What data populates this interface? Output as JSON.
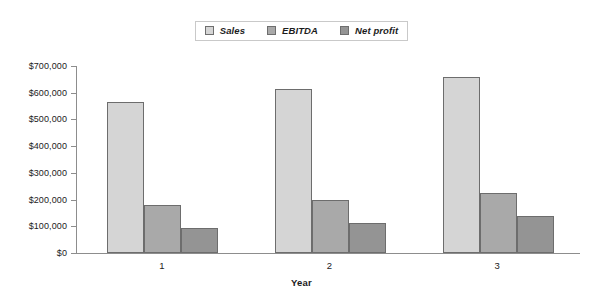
{
  "chart_data": {
    "type": "bar",
    "title": "",
    "xlabel": "Year",
    "ylabel": "",
    "categories": [
      "1",
      "2",
      "3"
    ],
    "series": [
      {
        "name": "Sales",
        "values": [
          565000,
          615000,
          660000
        ],
        "color": "#d5d5d5"
      },
      {
        "name": "EBITDA",
        "values": [
          178000,
          200000,
          225000
        ],
        "color": "#a9a9a9"
      },
      {
        "name": "Net profit",
        "values": [
          95000,
          112000,
          140000
        ],
        "color": "#949494"
      }
    ],
    "ylim": [
      0,
      700000
    ],
    "ytick_values": [
      0,
      100000,
      200000,
      300000,
      400000,
      500000,
      600000,
      700000
    ],
    "ytick_labels": [
      "$0",
      "$100,000",
      "$200,000",
      "$300,000",
      "$400,000",
      "$500,000",
      "$600,000",
      "$700,000"
    ],
    "grid": false,
    "legend_position": "top-center",
    "bar_border_color": "#6d6d6d",
    "axis_color": "#8d8d8d",
    "background": "#ffffff"
  }
}
